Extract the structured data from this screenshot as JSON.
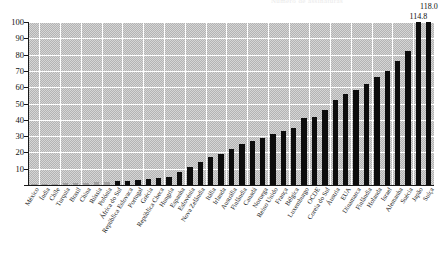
{
  "chart_data": {
    "type": "bar",
    "title": "Número de assinaturas",
    "xlabel": "",
    "ylabel": "",
    "ylim": [
      0,
      100
    ],
    "yticks": [
      0,
      10,
      20,
      30,
      40,
      50,
      60,
      70,
      80,
      90,
      100
    ],
    "ytick_labels": [
      "0",
      "10",
      "20",
      "30",
      "40",
      "50",
      "60",
      "70",
      "80",
      "90",
      "100"
    ],
    "grid": true,
    "legend": "none",
    "categories": [
      "México",
      "Índia",
      "Chile",
      "Turquia",
      "Brasil",
      "China",
      "Rússia",
      "Polónia",
      "África do Sul",
      "República Eslovaca",
      "Portugal",
      "Grécia",
      "República Checa",
      "Hungria",
      "Espanha",
      "Eslovénia",
      "Nova Zelândia",
      "Itália",
      "Irlanda",
      "Austrália",
      "Finlândia",
      "Canadá",
      "Noruega",
      "Reino Unido",
      "França",
      "Bélgica",
      "Luxemburgo",
      "OCDE",
      "Coreia do Sul",
      "Áustria",
      "EUA",
      "Dinamarca",
      "Finlândia",
      "Holanda",
      "Israel",
      "Alemanha",
      "Suécia",
      "Japão",
      "Suíça"
    ],
    "values": [
      0.4,
      0.6,
      0.8,
      1.0,
      1.2,
      1.5,
      1.8,
      2.0,
      2.3,
      2.6,
      3.0,
      3.4,
      4.0,
      5.0,
      8.0,
      11.0,
      14.0,
      17.0,
      19.0,
      22.0,
      25.0,
      27.0,
      29.0,
      31.0,
      33.0,
      35.0,
      41.0,
      42.0,
      46.0,
      52.0,
      56.0,
      58.0,
      62.0,
      66.0,
      70.0,
      76.0,
      82.0,
      114.8,
      118.0
    ],
    "value_labels": [
      "",
      "",
      "",
      "",
      "",
      "",
      "",
      "",
      "",
      "",
      "",
      "",
      "",
      "",
      "",
      "",
      "",
      "",
      "",
      "",
      "",
      "",
      "",
      "",
      "",
      "",
      "",
      "",
      "",
      "",
      "",
      "",
      "",
      "",
      "",
      "",
      "",
      "114.8",
      "118.0"
    ]
  }
}
